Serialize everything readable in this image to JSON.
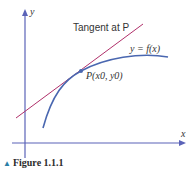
{
  "figure": {
    "caption_marker": "▲",
    "caption": "Figure 1.1.1",
    "axes": {
      "x_label": "x",
      "y_label": "y"
    },
    "labels": {
      "tangent": "Tangent at P",
      "curve": "y = f(x)",
      "point": "P(x0, y0)"
    },
    "colors": {
      "axis": "#5b63b8",
      "curve": "#4a67b0",
      "tangent": "#b0306a",
      "caption_marker": "#2a7fa6"
    }
  }
}
